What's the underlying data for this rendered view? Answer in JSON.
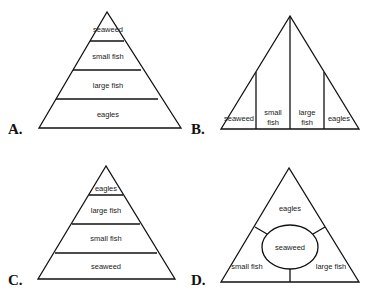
{
  "options": [
    {
      "letter": "A.",
      "type": "pyramid",
      "levels_top_to_bottom": [
        "seaweed",
        "small fish",
        "large fish",
        "eagles"
      ]
    },
    {
      "letter": "B.",
      "type": "vertical-split-triangle",
      "sections_left_to_right": [
        "seaweed",
        "small fish",
        "large fish",
        "eagles"
      ],
      "labels": {
        "small_fish_l1": "small",
        "small_fish_l2": "fish",
        "large_fish_l1": "large",
        "large_fish_l2": "fish"
      }
    },
    {
      "letter": "C.",
      "type": "pyramid",
      "levels_top_to_bottom": [
        "eagles",
        "large fish",
        "small fish",
        "seaweed"
      ]
    },
    {
      "letter": "D.",
      "type": "triangle-with-center-ellipse",
      "center": "seaweed",
      "regions": [
        "eagles",
        "small fish",
        "large fish"
      ]
    }
  ],
  "colors": {
    "line": "#111111",
    "text": "#222222",
    "background": "#ffffff"
  }
}
